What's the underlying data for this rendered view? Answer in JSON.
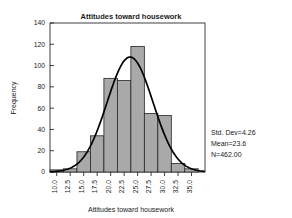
{
  "chart_data": {
    "type": "bar",
    "title": "Attitudes toward housework",
    "xlabel": "Attitudes toward housework",
    "ylabel": "Frequency",
    "grid": false,
    "legend": "none",
    "xlim": [
      8.75,
      37.5
    ],
    "ylim": [
      0,
      140
    ],
    "xticks": [
      "10.0",
      "12.5",
      "15.0",
      "17.5",
      "20.0",
      "22.5",
      "25.0",
      "27.5",
      "30.0",
      "32.5",
      "35.0"
    ],
    "xtick_values": [
      10.0,
      12.5,
      15.0,
      17.5,
      20.0,
      22.5,
      25.0,
      27.5,
      30.0,
      32.5,
      35.0
    ],
    "yticks": [
      "0",
      "20",
      "40",
      "60",
      "80",
      "100",
      "120",
      "140"
    ],
    "ytick_values": [
      0,
      20,
      40,
      60,
      80,
      100,
      120,
      140
    ],
    "bin_width": 2.5,
    "categories": [
      "10.0",
      "12.5",
      "15.0",
      "17.5",
      "20.0",
      "22.5",
      "25.0",
      "27.5",
      "30.0",
      "32.5",
      "35.0"
    ],
    "bin_centers": [
      10.0,
      12.5,
      15.0,
      17.5,
      20.0,
      22.5,
      25.0,
      27.5,
      30.0,
      32.5,
      35.0
    ],
    "values": [
      2,
      3,
      19,
      34,
      88,
      86,
      118,
      55,
      53,
      8,
      3
    ],
    "overlay": {
      "type": "normal-curve",
      "mean": 23.6,
      "std_dev": 4.26,
      "n": 462,
      "peak": 108
    },
    "annotations": [
      "Std. Dev=4.26",
      "Mean=23.6",
      "N=462.00"
    ]
  },
  "stats": {
    "std_dev": "Std. Dev=4.26",
    "mean": "Mean=23.6",
    "n": "N=462.00"
  },
  "colors": {
    "bar_fill": "#a9a9a9",
    "bar_stroke": "#262626",
    "curve": "#000000",
    "text": "#1a1a1a",
    "background": "#ffffff"
  }
}
